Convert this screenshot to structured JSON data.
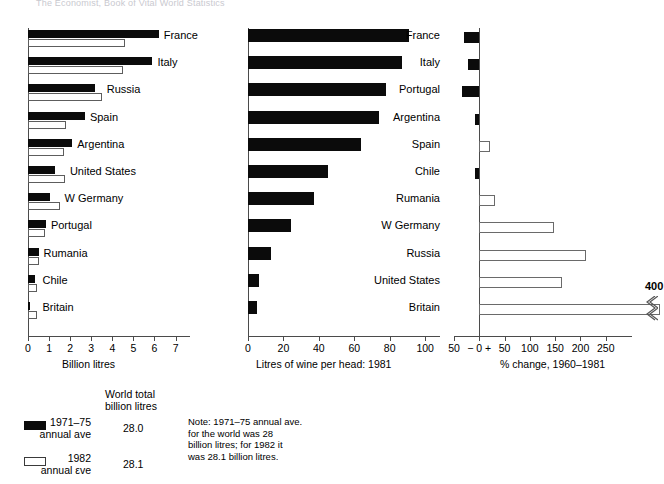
{
  "masthead": "The Economist, Book of Vital World Statistics",
  "legend": {
    "world_total_header_line1": "World total",
    "world_total_header_line2": "billion litres",
    "series": [
      {
        "swatch": "dark",
        "label_line1": "1971–75",
        "label_line2": "annual ave",
        "world_total": "28.0"
      },
      {
        "swatch": "light",
        "label_line1": "1982",
        "label_line2": "annual εve",
        "world_total": "28.1"
      }
    ],
    "note": "Note: 1971–75 annual ave.\nfor the world was 28\nbillion litres; for 1982 it\nwas 28.1 billion litres."
  },
  "chart_data": [
    {
      "id": "panel1",
      "type": "bar",
      "orientation": "horizontal",
      "title": "",
      "xlabel": "Billion litres",
      "ylabel": "",
      "xlim": [
        0,
        7.4
      ],
      "xticks": [
        0,
        1,
        2,
        3,
        4,
        5,
        6,
        7
      ],
      "grid": false,
      "legend_position": "below-figure",
      "categories": [
        "France",
        "Italy",
        "Russia",
        "Spain",
        "Argentina",
        "United States",
        "W Germany",
        "Portugal",
        "Rumania",
        "Chile",
        "Britain"
      ],
      "series": [
        {
          "name": "1971–75 annual ave",
          "style": "dark",
          "values": [
            6.2,
            5.9,
            3.2,
            2.7,
            2.1,
            1.3,
            1.05,
            0.85,
            0.5,
            0.35,
            0.05
          ]
        },
        {
          "name": "1982 annual ave",
          "style": "light",
          "values": [
            4.6,
            4.5,
            3.5,
            1.8,
            1.7,
            1.75,
            1.5,
            0.8,
            0.5,
            0.45,
            0.45
          ]
        }
      ]
    },
    {
      "id": "panel2",
      "type": "bar",
      "orientation": "horizontal",
      "title": "",
      "xlabel": "Litres of wine per head: 1981",
      "ylabel": "",
      "xlim": [
        0,
        105
      ],
      "xticks": [
        0,
        20,
        40,
        60,
        80,
        100
      ],
      "grid": false,
      "categories": [
        "France",
        "Italy",
        "Portugal",
        "Argentina",
        "Spain",
        "Chile",
        "Rumania",
        "W Germany",
        "Russia",
        "United States",
        "Britain"
      ],
      "series": [
        {
          "name": "Litres of wine per head: 1981",
          "style": "dark",
          "values": [
            91,
            87,
            78,
            74,
            64,
            45,
            37,
            24,
            13,
            6,
            5
          ]
        }
      ]
    },
    {
      "id": "panel3",
      "type": "bar",
      "orientation": "horizontal",
      "title": "",
      "xlabel": "% change, 1960–1981",
      "ylabel": "",
      "xlim": [
        -50,
        290
      ],
      "xticks": [
        -50,
        0,
        50,
        100,
        150,
        200,
        250
      ],
      "xticklabels": [
        "50",
        "− 0 +",
        "50",
        "100",
        "150",
        "200",
        "250"
      ],
      "grid": false,
      "categories": [
        "France",
        "Italy",
        "Portugal",
        "Argentina",
        "Spain",
        "Chile",
        "Rumania",
        "W Germany",
        "Russia",
        "United States",
        "Britain"
      ],
      "break_annotation": {
        "label": "400",
        "applies_to": "Britain"
      },
      "series": [
        {
          "name": "% change, 1960–1981",
          "values": [
            -30,
            -22,
            -35,
            -8,
            22,
            -8,
            32,
            148,
            210,
            163,
            400
          ],
          "styles": [
            "dark",
            "dark",
            "dark",
            "dark",
            "light",
            "dark",
            "light",
            "light",
            "light",
            "light",
            "light"
          ]
        }
      ]
    }
  ]
}
